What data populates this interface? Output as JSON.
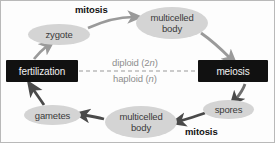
{
  "diagram": {
    "type": "cycle-diagram",
    "background_color": "#fdfdfd",
    "border_color": "#b9b9b9",
    "ellipse_fill": "#d4d4d4",
    "box_fill": "#111111",
    "box_text_color": "#f2f2f2",
    "arrow_color_light": "#9a9a9a",
    "arrow_color_dark": "#4a4a4a",
    "divider_color": "#9a9a9a",
    "ploidy_text_color": "#8e8e8e"
  },
  "nodes": {
    "zygote": {
      "label": "zygote",
      "shape": "ellipse"
    },
    "multicelled_body_top": {
      "line1": "multicelled",
      "line2": "body",
      "shape": "ellipse"
    },
    "meiosis": {
      "label": "meiosis",
      "shape": "box"
    },
    "spores": {
      "label": "spores",
      "shape": "ellipse"
    },
    "multicelled_body_bottom": {
      "line1": "multicelled",
      "line2": "body",
      "shape": "ellipse"
    },
    "gametes": {
      "label": "gametes",
      "shape": "ellipse"
    },
    "fertilization": {
      "label": "fertilization",
      "shape": "box"
    }
  },
  "edge_labels": {
    "mitosis_top": "mitosis",
    "mitosis_bottom": "mitosis"
  },
  "divider": {
    "above": {
      "text": "diploid (2",
      "italic": "n",
      "suffix": ")"
    },
    "below": {
      "text": "haploid (",
      "italic": "n",
      "suffix": ")"
    },
    "above_full": "diploid (2n)",
    "below_full": "haploid (n)",
    "style": "dashed"
  }
}
